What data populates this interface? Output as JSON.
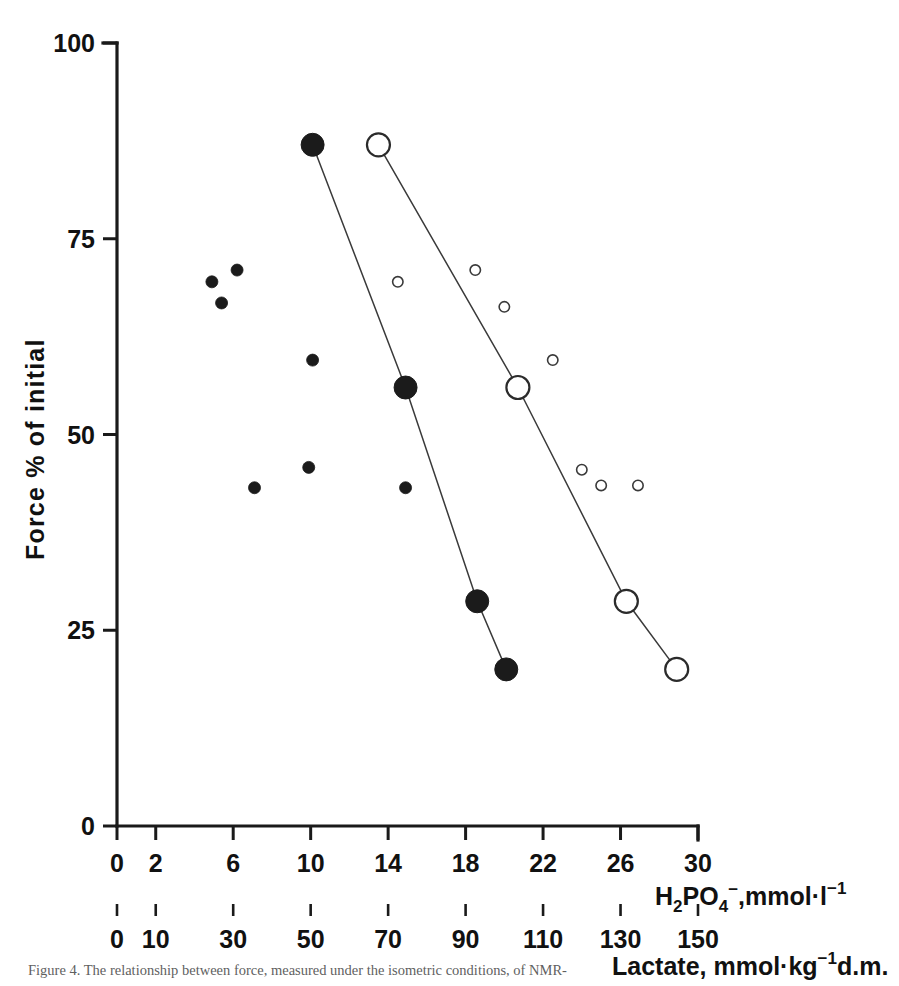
{
  "figure": {
    "caption_partial": "Figure 4.   The relationship between force, measured under the isometric conditions, of NMR-",
    "ylabel": "Force % of initial"
  },
  "axes": {
    "y": {
      "label": "Force % of initial",
      "ticks": [
        0,
        25,
        50,
        75,
        100
      ],
      "tick_labels": [
        "0",
        "25",
        "50",
        "75",
        "100"
      ],
      "min": 0,
      "max": 100
    },
    "x_primary": {
      "label_text": "H2PO4-, mmol·l-1",
      "label_parts": {
        "h": "H",
        "sub2": "2",
        "po": "PO",
        "sub4": "4",
        "charge": "−",
        "unit": ",mmol·l",
        "sup": "−1"
      },
      "ticks": [
        0,
        2,
        6,
        10,
        14,
        18,
        22,
        26,
        30
      ],
      "tick_labels": [
        "0",
        "2",
        "6",
        "10",
        "14",
        "18",
        "22",
        "26",
        "30"
      ],
      "min": 0,
      "max": 30
    },
    "x_secondary": {
      "label_parts": {
        "name": "Lactate, mmol·kg",
        "sup": "−1",
        "tail": "d.m."
      },
      "label_text": "Lactate, mmol·kg-1 d.m.",
      "ticks": [
        0,
        10,
        30,
        50,
        70,
        90,
        110,
        130,
        150
      ],
      "tick_labels": [
        "0",
        "10",
        "30",
        "50",
        "70",
        "90",
        "110",
        "130",
        "150"
      ],
      "min": 0,
      "max": 150
    }
  },
  "chart_data": {
    "type": "scatter",
    "title": "",
    "xlabel": "H2PO4-, mmol·l-1  /  Lactate, mmol·kg-1 d.m.",
    "ylabel": "Force % of initial",
    "xlim": [
      0,
      30
    ],
    "ylim": [
      0,
      100
    ],
    "grid": false,
    "legend": "none",
    "series": [
      {
        "name": "mean-filled-connected",
        "marker": "filled-circle-large",
        "connected": true,
        "x": [
          10.1,
          14.9,
          18.6,
          20.1
        ],
        "y": [
          87.0,
          56.0,
          28.7,
          20.0
        ]
      },
      {
        "name": "mean-open-connected",
        "marker": "open-circle-large",
        "connected": true,
        "x": [
          13.5,
          20.7,
          26.3,
          28.9
        ],
        "y": [
          87.0,
          56.0,
          28.7,
          20.0
        ]
      },
      {
        "name": "individual-filled",
        "marker": "filled-circle-small",
        "connected": false,
        "x": [
          4.9,
          6.2,
          5.4,
          10.1,
          7.1,
          9.9,
          14.9
        ],
        "y": [
          69.5,
          71.0,
          66.8,
          59.5,
          43.2,
          45.8,
          43.2
        ]
      },
      {
        "name": "individual-open",
        "marker": "open-circle-small",
        "connected": false,
        "x": [
          14.5,
          18.5,
          20.0,
          22.5,
          24.0,
          25.0,
          26.9
        ],
        "y": [
          69.5,
          71.0,
          66.3,
          59.5,
          45.5,
          43.5,
          43.5
        ]
      }
    ]
  },
  "colors": {
    "ink": "#1a1a1a",
    "line": "#3a3a3a",
    "background": "#ffffff",
    "caption": "#5f5f5f"
  }
}
